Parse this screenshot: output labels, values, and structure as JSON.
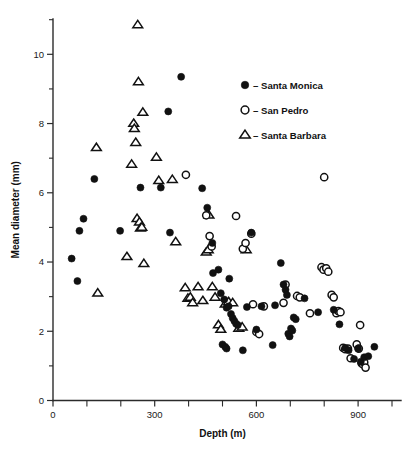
{
  "chart_data": {
    "type": "scatter",
    "title": "",
    "xlabel": "Depth (m)",
    "ylabel": "Mean diameter (mm)",
    "xlim": [
      0,
      1000
    ],
    "ylim": [
      0,
      11
    ],
    "grid": false,
    "legend_position": "upper-right",
    "x_ticks_major": [
      0,
      300,
      600,
      900
    ],
    "x_ticks_minor": [
      100,
      200,
      400,
      500,
      700,
      800,
      1000
    ],
    "x_tick_labels": [
      "0",
      "300",
      "600",
      "900"
    ],
    "y_ticks_major": [
      0,
      2,
      4,
      6,
      8,
      10
    ],
    "y_ticks_minor": [
      1,
      3,
      5,
      7,
      9,
      11
    ],
    "y_tick_labels": [
      "0",
      "2",
      "4",
      "6",
      "8",
      "10"
    ],
    "series": [
      {
        "name": "Santa Monica",
        "marker": "filled-circle",
        "color": "#111111",
        "points": [
          [
            55,
            4.1
          ],
          [
            72,
            3.45
          ],
          [
            78,
            4.9
          ],
          [
            90,
            5.25
          ],
          [
            122,
            6.4
          ],
          [
            198,
            4.9
          ],
          [
            258,
            6.15
          ],
          [
            318,
            6.15
          ],
          [
            340,
            8.35
          ],
          [
            345,
            4.85
          ],
          [
            378,
            9.35
          ],
          [
            440,
            6.13
          ],
          [
            455,
            5.57
          ],
          [
            470,
            4.55
          ],
          [
            472,
            3.68
          ],
          [
            488,
            3.78
          ],
          [
            495,
            3.1
          ],
          [
            505,
            2.92
          ],
          [
            512,
            2.68
          ],
          [
            518,
            2.72
          ],
          [
            520,
            3.52
          ],
          [
            525,
            2.5
          ],
          [
            530,
            2.38
          ],
          [
            535,
            2.3
          ],
          [
            540,
            2.22
          ],
          [
            545,
            2.18
          ],
          [
            500,
            1.62
          ],
          [
            508,
            1.55
          ],
          [
            512,
            1.5
          ],
          [
            560,
            1.45
          ],
          [
            572,
            2.7
          ],
          [
            585,
            4.85
          ],
          [
            600,
            2.05
          ],
          [
            615,
            2.72
          ],
          [
            648,
            1.6
          ],
          [
            655,
            2.75
          ],
          [
            672,
            3.97
          ],
          [
            680,
            3.35
          ],
          [
            686,
            3.2
          ],
          [
            690,
            3.05
          ],
          [
            694,
            1.93
          ],
          [
            698,
            1.85
          ],
          [
            702,
            2.08
          ],
          [
            706,
            2.02
          ],
          [
            710,
            2.4
          ],
          [
            716,
            2.35
          ],
          [
            742,
            2.95
          ],
          [
            782,
            2.55
          ],
          [
            828,
            2.62
          ],
          [
            845,
            2.2
          ],
          [
            862,
            1.52
          ],
          [
            872,
            1.45
          ],
          [
            888,
            1.2
          ],
          [
            900,
            1.5
          ],
          [
            908,
            1.12
          ],
          [
            918,
            1.25
          ],
          [
            930,
            1.28
          ],
          [
            948,
            1.55
          ]
        ]
      },
      {
        "name": "San Pedro",
        "marker": "open-circle",
        "color": "#ffffff",
        "points": [
          [
            392,
            6.52
          ],
          [
            452,
            5.35
          ],
          [
            462,
            4.75
          ],
          [
            468,
            4.45
          ],
          [
            540,
            5.33
          ],
          [
            560,
            4.38
          ],
          [
            568,
            4.55
          ],
          [
            585,
            4.82
          ],
          [
            590,
            2.78
          ],
          [
            600,
            1.98
          ],
          [
            608,
            1.92
          ],
          [
            622,
            2.72
          ],
          [
            680,
            2.82
          ],
          [
            686,
            3.35
          ],
          [
            720,
            3.02
          ],
          [
            728,
            2.98
          ],
          [
            758,
            2.52
          ],
          [
            792,
            3.85
          ],
          [
            798,
            3.78
          ],
          [
            806,
            3.82
          ],
          [
            812,
            3.72
          ],
          [
            800,
            6.45
          ],
          [
            822,
            3.05
          ],
          [
            828,
            2.98
          ],
          [
            836,
            2.52
          ],
          [
            842,
            2.58
          ],
          [
            848,
            2.55
          ],
          [
            856,
            1.52
          ],
          [
            862,
            1.48
          ],
          [
            870,
            1.5
          ],
          [
            878,
            1.22
          ],
          [
            896,
            1.62
          ],
          [
            902,
            1.5
          ],
          [
            906,
            2.18
          ],
          [
            910,
            1.08
          ],
          [
            914,
            1.05
          ],
          [
            918,
            1.1
          ],
          [
            922,
            0.95
          ]
        ]
      },
      {
        "name": "Santa Barbara",
        "marker": "open-triangle",
        "color": "#ffffff",
        "points": [
          [
            128,
            7.3
          ],
          [
            132,
            3.1
          ],
          [
            218,
            4.15
          ],
          [
            232,
            6.82
          ],
          [
            238,
            8.0
          ],
          [
            240,
            7.85
          ],
          [
            244,
            7.45
          ],
          [
            248,
            5.25
          ],
          [
            250,
            10.85
          ],
          [
            252,
            9.2
          ],
          [
            255,
            5.15
          ],
          [
            258,
            4.98
          ],
          [
            262,
            5.0
          ],
          [
            265,
            8.32
          ],
          [
            268,
            3.95
          ],
          [
            305,
            7.02
          ],
          [
            312,
            6.35
          ],
          [
            352,
            6.38
          ],
          [
            362,
            4.58
          ],
          [
            390,
            3.25
          ],
          [
            398,
            2.95
          ],
          [
            405,
            2.98
          ],
          [
            412,
            2.82
          ],
          [
            428,
            3.28
          ],
          [
            442,
            2.88
          ],
          [
            452,
            4.28
          ],
          [
            458,
            4.35
          ],
          [
            460,
            5.35
          ],
          [
            470,
            3.28
          ],
          [
            478,
            2.98
          ],
          [
            488,
            2.18
          ],
          [
            495,
            2.05
          ],
          [
            508,
            2.78
          ],
          [
            518,
            2.85
          ],
          [
            530,
            2.82
          ],
          [
            548,
            2.08
          ],
          [
            558,
            2.12
          ],
          [
            570,
            4.35
          ]
        ]
      }
    ]
  },
  "legend": {
    "items": [
      {
        "marker": "filled-circle",
        "dash": "–",
        "label": "Santa Monica"
      },
      {
        "marker": "open-circle",
        "dash": "–",
        "label": "San Pedro"
      },
      {
        "marker": "open-triangle",
        "dash": "–",
        "label": "Santa Barbara"
      }
    ]
  }
}
